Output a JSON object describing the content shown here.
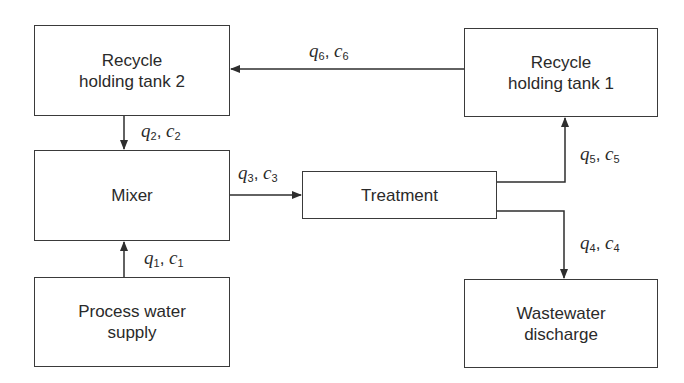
{
  "diagram": {
    "type": "process-flow",
    "nodes": [
      {
        "id": "rht2",
        "label_line1": "Recycle",
        "label_line2": "holding tank 2"
      },
      {
        "id": "mixer",
        "label_line1": "Mixer",
        "label_line2": ""
      },
      {
        "id": "pws",
        "label_line1": "Process water",
        "label_line2": "supply"
      },
      {
        "id": "treatment",
        "label_line1": "Treatment",
        "label_line2": ""
      },
      {
        "id": "rht1",
        "label_line1": "Recycle",
        "label_line2": "holding tank 1"
      },
      {
        "id": "wd",
        "label_line1": "Wastewater",
        "label_line2": "discharge"
      }
    ],
    "edges": [
      {
        "from": "pws",
        "to": "mixer",
        "q": "q",
        "qs": "1",
        "c": "c",
        "cs": "1"
      },
      {
        "from": "rht2",
        "to": "mixer",
        "q": "q",
        "qs": "2",
        "c": "c",
        "cs": "2"
      },
      {
        "from": "mixer",
        "to": "treatment",
        "q": "q",
        "qs": "3",
        "c": "c",
        "cs": "3"
      },
      {
        "from": "treatment",
        "to": "wd",
        "q": "q",
        "qs": "4",
        "c": "c",
        "cs": "4"
      },
      {
        "from": "treatment",
        "to": "rht1",
        "q": "q",
        "qs": "5",
        "c": "c",
        "cs": "5"
      },
      {
        "from": "rht1",
        "to": "rht2",
        "q": "q",
        "qs": "6",
        "c": "c",
        "cs": "6"
      }
    ],
    "colors": {
      "line": "#2e2e2e",
      "box_border": "#3a3a3a",
      "background": "#ffffff"
    }
  }
}
